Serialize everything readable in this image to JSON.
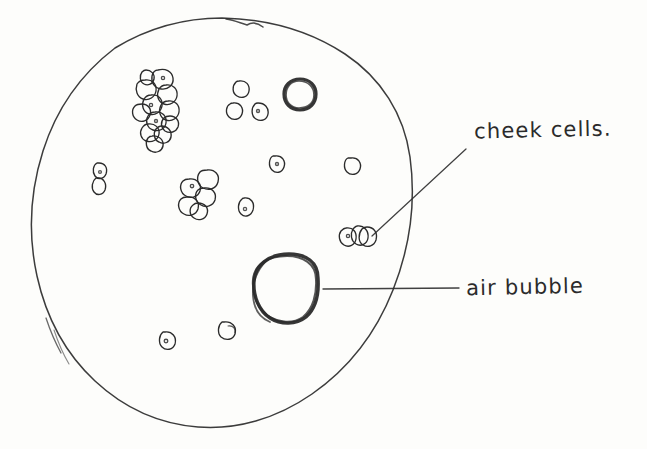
{
  "drawing": {
    "title": "Cheek cells under the microscope",
    "medium": "pencil sketch on paper",
    "paper_color": "#fdfdfb",
    "ink_color": "#2b2b2b"
  },
  "labels": [
    {
      "id": "cheek-cells",
      "text": "cheek cells.",
      "x": 474,
      "y": 118,
      "leader": {
        "from_x": 465,
        "from_y": 150,
        "to_x": 370,
        "to_y": 237
      }
    },
    {
      "id": "air-bubble",
      "text": "air bubble",
      "x": 466,
      "y": 275,
      "leader": {
        "from_x": 458,
        "from_y": 288,
        "to_x": 322,
        "to_y": 289
      }
    }
  ],
  "field_of_view": {
    "name": "microscope field of view",
    "shape": "circle",
    "center_x": 222,
    "center_y": 223,
    "radius_x": 189,
    "radius_y": 205
  },
  "air_bubbles": [
    {
      "id": "air-bubble-large",
      "center_x": 289,
      "center_y": 288,
      "radius_x": 30,
      "radius_y": 34
    },
    {
      "id": "air-bubble-small",
      "center_x": 300,
      "center_y": 94,
      "radius_x": 15,
      "radius_y": 16
    }
  ],
  "cell_clusters": [
    {
      "id": "cluster-upper-left",
      "center_x": 162,
      "center_y": 99,
      "cell_count": 12
    },
    {
      "id": "cluster-mid-left",
      "center_x": 196,
      "center_y": 190,
      "cell_count": 5
    },
    {
      "id": "cluster-labelled",
      "center_x": 355,
      "center_y": 234,
      "cell_count": 3
    }
  ],
  "isolated_cells": [
    {
      "id": "cell-left-figure-eight",
      "x": 99,
      "y": 177
    },
    {
      "id": "cell-top-upper",
      "x": 239,
      "y": 88
    },
    {
      "id": "cell-top-left-lower",
      "x": 233,
      "y": 110
    },
    {
      "id": "cell-top-right-lower",
      "x": 258,
      "y": 110
    },
    {
      "id": "cell-mid-centre",
      "x": 275,
      "y": 163
    },
    {
      "id": "cell-mid-right",
      "x": 351,
      "y": 165
    },
    {
      "id": "cell-centre",
      "x": 244,
      "y": 206
    },
    {
      "id": "cell-bottom-left",
      "x": 165,
      "y": 340
    },
    {
      "id": "cell-bottom-right",
      "x": 224,
      "y": 330
    }
  ]
}
